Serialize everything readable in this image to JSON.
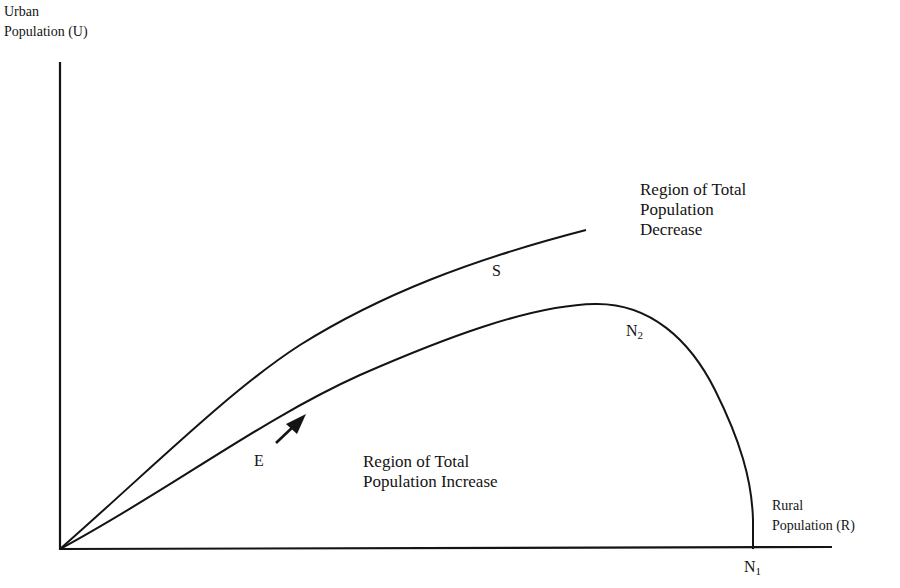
{
  "axes": {
    "y_label_line1": "Urban",
    "y_label_line2": "Population (U)",
    "x_label_line1": "Rural",
    "x_label_line2": "Population (R)"
  },
  "regions": {
    "decrease_line1": "Region of Total",
    "decrease_line2": "Population",
    "decrease_line3": "Decrease",
    "increase_line1": "Region of Total",
    "increase_line2": "Population Increase"
  },
  "curves": {
    "S": {
      "label": "S"
    },
    "N2": {
      "label": "N",
      "subscript": "2"
    },
    "N1": {
      "label": "N",
      "subscript": "1"
    },
    "E": {
      "label": "E"
    }
  },
  "colors": {
    "line": "#141414",
    "background": "#ffffff"
  }
}
